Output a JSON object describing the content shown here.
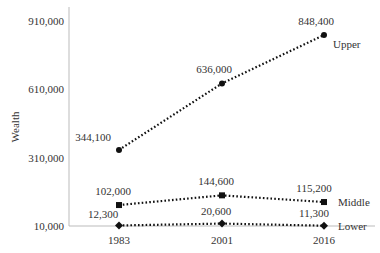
{
  "chart_data": {
    "type": "line",
    "title": "",
    "xlabel": "",
    "ylabel": "Wealth",
    "categories": [
      "1983",
      "2001",
      "2016"
    ],
    "ylim": [
      10000,
      910000
    ],
    "yticks": [
      "10,000",
      "310,000",
      "610,000",
      "910,000"
    ],
    "grid": false,
    "legend": "inline labels at line ends",
    "series": [
      {
        "name": "Upper",
        "values": [
          344100,
          636000,
          848400
        ],
        "labels": [
          "344,100",
          "636,000",
          "848,400"
        ],
        "marker": "circle"
      },
      {
        "name": "Middle",
        "values": [
          102000,
          144600,
          115200
        ],
        "labels": [
          "102,000",
          "144,600",
          "115,200"
        ],
        "marker": "square"
      },
      {
        "name": "Lower",
        "values": [
          12300,
          20600,
          11300
        ],
        "labels": [
          "12,300",
          "20,600",
          "11,300"
        ],
        "marker": "diamond"
      }
    ]
  },
  "colors": {
    "line": "#111111",
    "axis": "#bbbbbb",
    "text": "#333333"
  }
}
